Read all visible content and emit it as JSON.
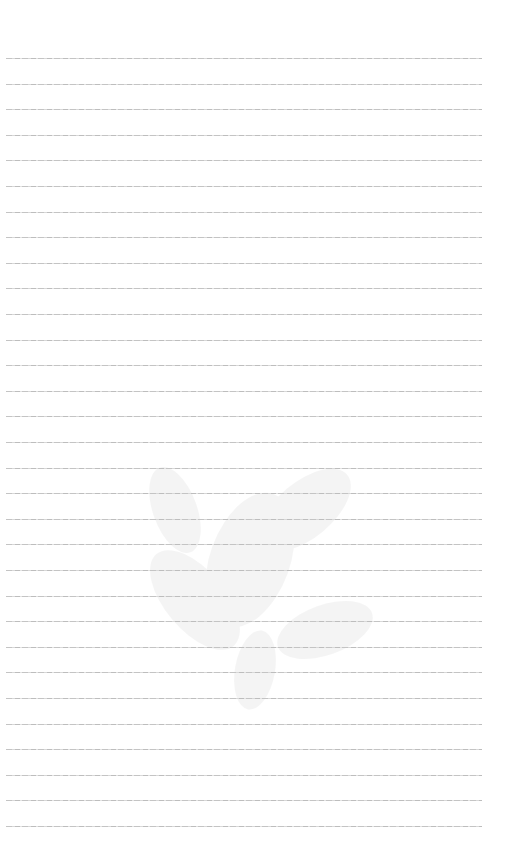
{
  "page": {
    "type": "ruled-paper",
    "background": "#ffffff",
    "rule_color": "#c8c8c8",
    "rules": {
      "count": 31,
      "first_y": 58,
      "spacing": 25.6,
      "x_start": 6,
      "x_end": 482
    },
    "watermark": {
      "icon": "floral-watermark-icon",
      "opacity": 0.06
    }
  }
}
